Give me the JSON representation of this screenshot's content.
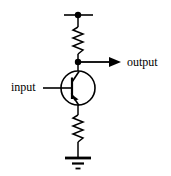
{
  "figure": {
    "type": "circuit-schematic",
    "title": "",
    "background_color": "#ffffff",
    "stroke_color": "#000000",
    "width": 171,
    "height": 176
  },
  "labels": {
    "input": "input",
    "output": "output"
  },
  "components": [
    {
      "id": "supply-rail",
      "name": "supply-rail",
      "kind": "wire",
      "orientation": "horizontal",
      "x1": 64,
      "y1": 15,
      "x2": 93,
      "y2": 15
    },
    {
      "id": "supply-node",
      "name": "supply-junction-dot",
      "kind": "junction",
      "cx": 78,
      "cy": 15,
      "r": 3.2
    },
    {
      "id": "collector-resistor",
      "name": "collector-resistor",
      "kind": "resistor",
      "orientation": "vertical",
      "x": 78,
      "y_top": 17,
      "y_bottom": 62,
      "zig_top": 27,
      "zig_bottom": 54,
      "amplitude": 5,
      "peaks": 6
    },
    {
      "id": "output-node",
      "name": "output-junction-dot",
      "kind": "junction",
      "cx": 78,
      "cy": 62,
      "r": 3.2
    },
    {
      "id": "output-wire",
      "name": "output-wire",
      "kind": "wire-with-arrow",
      "x1": 78,
      "y1": 62,
      "x2": 120,
      "y2": 62,
      "arrow_tip_x": 121,
      "arrow_half_height": 4.5,
      "arrow_length": 11
    },
    {
      "id": "transistor",
      "name": "pnp-transistor",
      "kind": "bjt",
      "polarity": "pnp",
      "cx": 78,
      "cy": 88,
      "r": 17,
      "base_bar_x": 72,
      "base_bar_y1": 78,
      "base_bar_y2": 99,
      "collector_lead": {
        "x1": 72,
        "y1": 82,
        "x2": 80,
        "y2": 71
      },
      "emitter_lead": {
        "x1": 72,
        "y1": 95,
        "x2": 80,
        "y2": 106
      },
      "emitter_arrow_on": "emitter",
      "arrow_points_toward": "base"
    },
    {
      "id": "base-wire",
      "name": "input-base-wire",
      "kind": "wire",
      "orientation": "horizontal",
      "x1": 43,
      "y1": 88,
      "x2": 72,
      "y2": 88
    },
    {
      "id": "collector-wire",
      "name": "collector-wire",
      "kind": "wire",
      "orientation": "vertical",
      "x1": 78,
      "y1": 62,
      "x2": 78,
      "y2": 72
    },
    {
      "id": "emitter-wire",
      "name": "emitter-wire",
      "kind": "wire",
      "orientation": "vertical",
      "x1": 78,
      "y1": 105,
      "x2": 78,
      "y2": 113
    },
    {
      "id": "emitter-resistor",
      "name": "emitter-resistor",
      "kind": "resistor",
      "orientation": "vertical",
      "x": 78,
      "y_top": 110,
      "y_bottom": 158,
      "zig_top": 115,
      "zig_bottom": 142,
      "amplitude": 5,
      "peaks": 6
    },
    {
      "id": "ground-wire",
      "name": "ground-wire",
      "kind": "wire",
      "orientation": "vertical",
      "x1": 78,
      "y1": 142,
      "x2": 78,
      "y2": 158
    },
    {
      "id": "ground",
      "name": "ground-symbol",
      "kind": "ground",
      "cx": 78,
      "bars": [
        {
          "y": 158,
          "half_width": 13,
          "thickness": 2.6
        },
        {
          "y": 163,
          "half_width": 6,
          "thickness": 2.2
        },
        {
          "y": 168,
          "half_width": 2.5,
          "thickness": 1.8
        }
      ]
    }
  ]
}
